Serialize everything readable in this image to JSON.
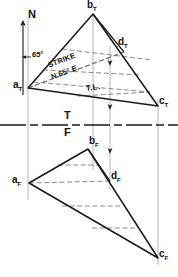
{
  "drawing": {
    "title": "Descriptive geometry: strike and true length on plane ABC",
    "type": "orthographic-two-view",
    "line_color": "#1a1a1a",
    "dash_color": "#555555",
    "projection_color": "#888888"
  },
  "north": {
    "label": "N",
    "arrow": "north-arrow-up"
  },
  "angle": {
    "value": "65°",
    "arrow": "angle-arrow"
  },
  "strike": {
    "line1": "STRIKE",
    "line2": "N 65° E"
  },
  "true_length": {
    "label": "T.L."
  },
  "fold_line": {
    "top_label": "T",
    "bottom_label": "F"
  },
  "top_view": {
    "vertices": [
      {
        "name": "a",
        "sub": "T",
        "x": 28,
        "y": 88
      },
      {
        "name": "b",
        "sub": "T",
        "x": 93,
        "y": 14
      },
      {
        "name": "c",
        "sub": "T",
        "x": 158,
        "y": 106
      },
      {
        "name": "d",
        "sub": "T",
        "x": 124,
        "y": 52
      }
    ],
    "labels": [
      {
        "text": "a",
        "sub": "T",
        "x": 15,
        "y": 83
      },
      {
        "text": "b",
        "sub": "T",
        "x": 89,
        "y": 1
      },
      {
        "text": "c",
        "sub": "T",
        "x": 160,
        "y": 99
      },
      {
        "text": "d",
        "sub": "T",
        "x": 120,
        "y": 40
      }
    ]
  },
  "front_view": {
    "vertices": [
      {
        "name": "a",
        "sub": "F",
        "x": 29,
        "y": 183
      },
      {
        "name": "b",
        "sub": "F",
        "x": 88,
        "y": 149
      },
      {
        "name": "c",
        "sub": "F",
        "x": 158,
        "y": 258
      },
      {
        "name": "d",
        "sub": "F",
        "x": 110,
        "y": 181
      }
    ],
    "labels": [
      {
        "text": "a",
        "sub": "F",
        "x": 14,
        "y": 177
      },
      {
        "text": "b",
        "sub": "F",
        "x": 90,
        "y": 138
      },
      {
        "text": "c",
        "sub": "F",
        "x": 160,
        "y": 252
      },
      {
        "text": "d",
        "sub": "F",
        "x": 112,
        "y": 173
      }
    ]
  }
}
